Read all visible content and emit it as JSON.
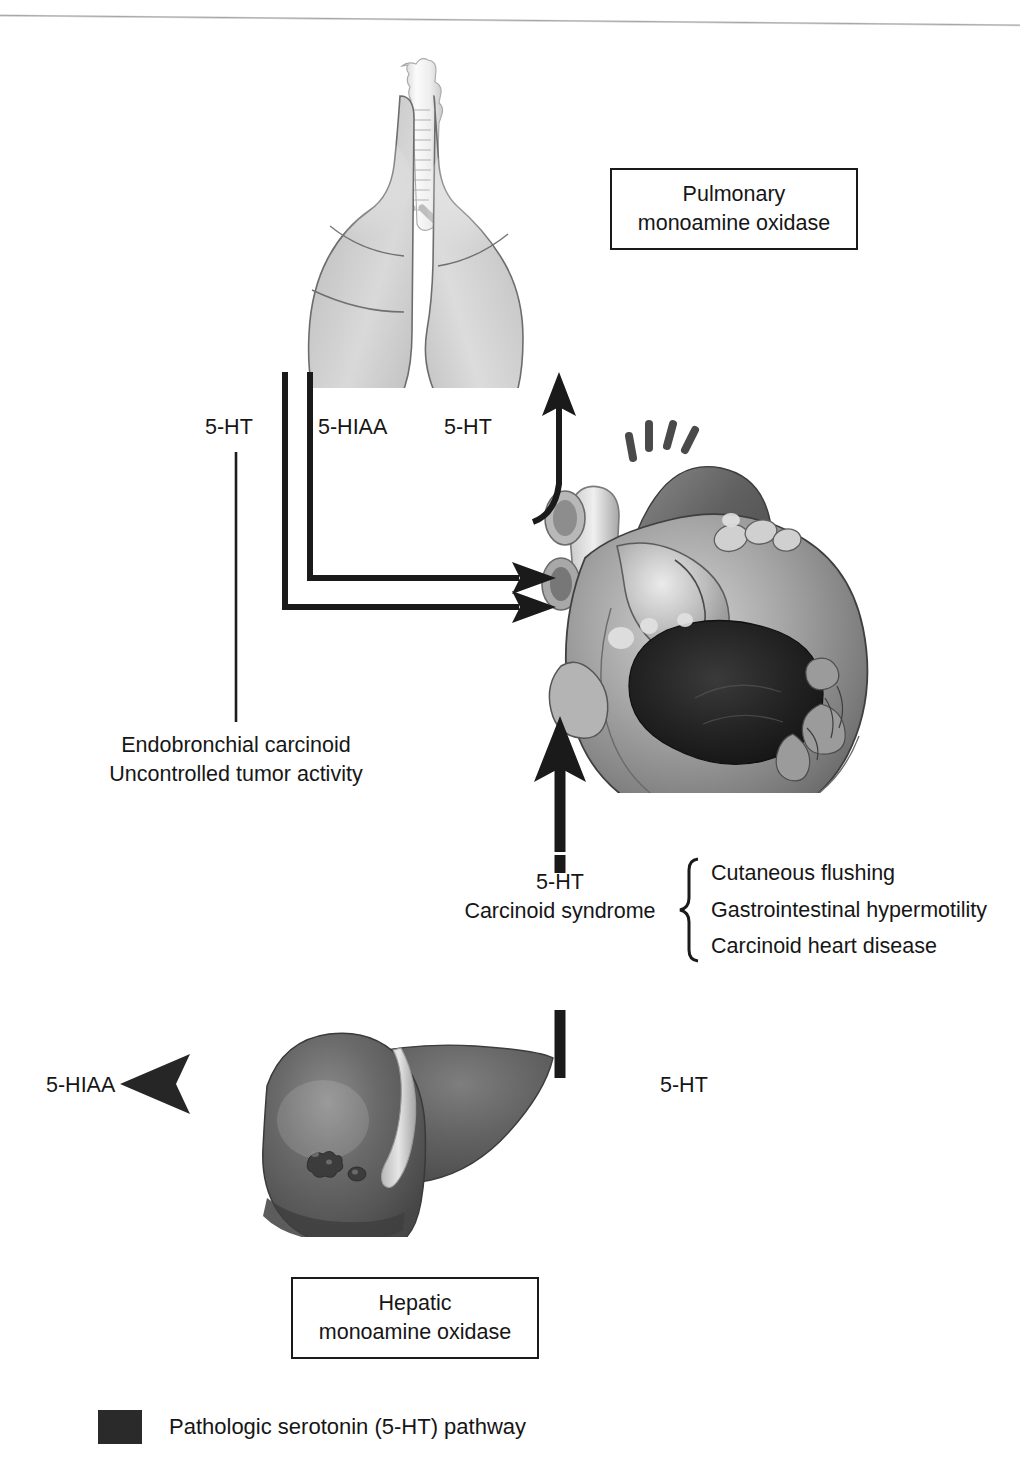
{
  "diagram": {
    "title": "Pathologic serotonin (5-HT) pathway",
    "boxes": {
      "pulmonary": {
        "line1": "Pulmonary",
        "line2": "monoamine oxidase"
      },
      "hepatic": {
        "line1": "Hepatic",
        "line2": "monoamine oxidase"
      }
    },
    "labels": {
      "lung_5ht": "5-HT",
      "lung_5hiaa": "5-HIAA",
      "heart_up_5ht": "5-HT",
      "endobronchial_1": "Endobronchial carcinoid",
      "endobronchial_2": "Uncontrolled tumor activity",
      "carcinoid_5ht": "5-HT",
      "carcinoid_sy": "Carcinoid syndrome",
      "liver_out_5hiaa": "5-HIAA",
      "liver_in_5ht": "5-HT"
    },
    "symptoms": [
      "Cutaneous flushing",
      "Gastrointestinal hypermotility",
      "Carcinoid heart disease"
    ],
    "organs": {
      "lungs": "lungs-illustration",
      "heart": "heart-illustration",
      "liver": "liver-illustration"
    },
    "legend": {
      "swatch_color": "#2a2a2a",
      "text": "Pathologic serotonin (5-HT) pathway"
    },
    "colors": {
      "ink": "#1a1a1a",
      "arrow_dark": "#262626",
      "arrow_fade": "#b9b9b9",
      "organ_gray": "#8f8f8f",
      "page": "#ffffff"
    }
  }
}
